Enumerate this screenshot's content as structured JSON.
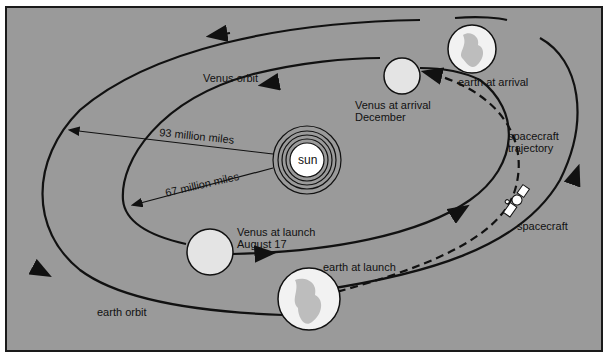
{
  "colors": {
    "background": "#9a9a9a",
    "line": "#111111",
    "planet": "#e4e4e4",
    "earth_land": "#bdbdbd"
  },
  "labels": {
    "sun": "sun",
    "venus_orbit": "Venus orbit",
    "earth_orbit": "earth orbit",
    "dist_earth": "93 million miles",
    "dist_venus": "67 million miles",
    "venus_arrival_1": "Venus at arrival",
    "venus_arrival_2": "December",
    "earth_arrival": "earth at arrival",
    "traj_1": "spacecraft",
    "traj_2": "trajectory",
    "spacecraft": "spacecraft",
    "venus_launch_1": "Venus at launch",
    "venus_launch_2": "August 17",
    "earth_launch": "earth at launch"
  }
}
